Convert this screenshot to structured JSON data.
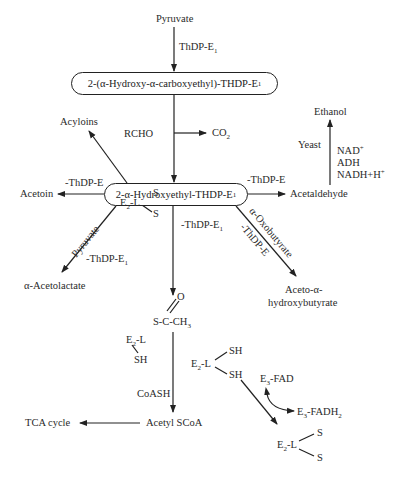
{
  "diagram": {
    "nodes": {
      "pyruvate_top": "Pyruvate",
      "hac_thdp": "2-(α-Hydroxy-α-carboxyethyl)-THDP-E",
      "hac_thdp_sub": "1",
      "he_thdp": "2-α-Hydroxyethyl-THDP-E",
      "he_thdp_sub": "1",
      "acyloins": "Acyloins",
      "acetoin": "Acetoin",
      "acetaldehyde": "Acetaldehyde",
      "ethanol": "Ethanol",
      "acetolactate": "α-Acetolactate",
      "aceto_hb_line1": "Aceto-α-",
      "aceto_hb_line2": "hydroxybutyrate",
      "acetyl_lipoyl_o": "O",
      "acetyl_lipoyl": "S-C-CH",
      "acetyl_lipoyl_sub": "3",
      "e2l_sh_top": "E",
      "e2l_sh_top_rest": "-L",
      "sh1": "SH",
      "e2l_dihydro": "E",
      "e2l_dihydro_rest": "-L",
      "sh2": "SH",
      "sh3": "SH",
      "e3fad": "E",
      "e3fad_rest": "-FAD",
      "e3fadh2": "E",
      "e3fadh2_rest": "-FADH",
      "e3fadh2_sub": "2",
      "e2l_ox_bottom": "E",
      "e2l_ox_bottom_rest": "-L",
      "s_bottom_1": "S",
      "s_bottom_2": "S",
      "e2l_ox_mid": "E",
      "e2l_ox_mid_rest": "-L",
      "s_mid_1": "S",
      "s_mid_2": "S",
      "acetyl_scoa": "Acetyl SCoA",
      "tca": "TCA cycle"
    },
    "edge_labels": {
      "thdp_e1_top": "ThDP-E",
      "thdp_e1_top_sub": "1",
      "rcho": "RCHO",
      "co2": "CO",
      "co2_sub": "2",
      "minus_thdp_e_left": "-ThDP-E",
      "minus_thdp_e_right": "-ThDP-E",
      "yeast": "Yeast",
      "nad": "NAD",
      "nad_sup": "+",
      "adh": "ADH",
      "nadh": "NADH+H",
      "nadh_sup": "+",
      "pyruvate_diag": "Pyruvate",
      "minus_thdp_e1_left": "-ThDP-E",
      "minus_thdp_e1_left_sub": "1",
      "minus_thdp_e1_mid": "-ThDP-E",
      "minus_thdp_e1_mid_sub": "1",
      "oxobutyrate_diag": "α-Oxobutyrate",
      "minus_thdp_e_diag": "-ThDP-E",
      "e2_sub": "2",
      "e3_sub": "3",
      "coash": "CoASH"
    },
    "colors": {
      "line": "#222222",
      "text": "#2a2a2a",
      "background": "#ffffff"
    }
  }
}
